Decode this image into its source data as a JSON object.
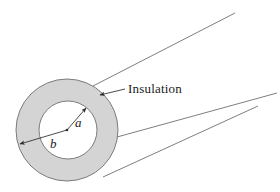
{
  "figure": {
    "background_color": "#ffffff",
    "labels": {
      "insulation": "Insulation",
      "inner_radius": "a",
      "outer_radius": "b"
    },
    "colors": {
      "annulus_fill": "#d4d4d4",
      "inner_fill": "#ffffff",
      "stroke": "#6f6f6f",
      "leader_stroke": "#2a2a2a",
      "text": "#1a1a1a"
    },
    "geometry": {
      "center_x": 67,
      "center_y": 130,
      "outer_radius": 51,
      "inner_radius": 29,
      "body_lines": [
        {
          "name": "top-edge",
          "x1": 93,
          "y1": 86,
          "x2": 235,
          "y2": 13
        },
        {
          "name": "middle-edge",
          "x1": 117,
          "y1": 137,
          "x2": 277,
          "y2": 93
        },
        {
          "name": "bottom-edge",
          "x1": 103,
          "y1": 177,
          "x2": 258,
          "y2": 106
        }
      ],
      "leader_line": {
        "x1": 125,
        "y1": 89,
        "x2": 100,
        "y2": 95
      },
      "radius_a_arrow": {
        "x1": 67,
        "y1": 130,
        "x2": 86,
        "y2": 108
      },
      "radius_b_arrow": {
        "x1": 67,
        "y1": 130,
        "x2": 20,
        "y2": 144
      }
    }
  }
}
